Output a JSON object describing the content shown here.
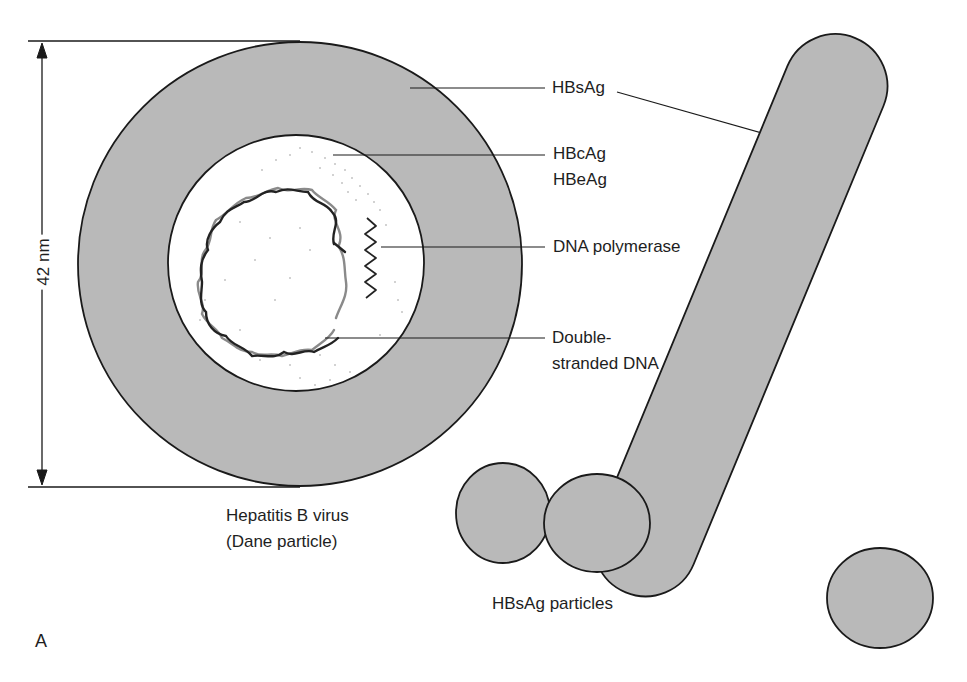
{
  "diagram": {
    "panel_letter": "A",
    "dimension_label": "42 nm",
    "virus_caption": [
      "Hepatitis B virus",
      "(Dane particle)"
    ],
    "particles_caption": "HBsAg particles",
    "labels": {
      "hbsag": "HBsAg",
      "hbcag": "HBcAg",
      "hbeag": "HBeAg",
      "dna_polymerase": "DNA polymerase",
      "dsdna_line1": "Double-",
      "dsdna_line2": "stranded DNA"
    },
    "colors": {
      "shell_fill": "#b9b9b9",
      "core_fill": "#ffffff",
      "outline": "#1a1a1a",
      "dna_dark": "#222222",
      "dna_light": "#8a8a8a"
    }
  }
}
